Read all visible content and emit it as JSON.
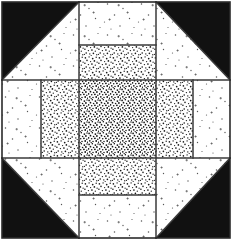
{
  "figure": {
    "title": "Quilt Block Pattern",
    "kind": "quilt-block-diagram",
    "width": 234,
    "height": 243,
    "background_color": "#ffffff",
    "outline_color": "#000000"
  },
  "colors": {
    "black": "#111111",
    "white": "#ffffff",
    "line": "#3a3a3a",
    "stipple_dot": "#1a1a1a",
    "speckle_dot": "#555555",
    "frame": "#2b2b2b"
  },
  "geometry": {
    "frame": {
      "x": 2,
      "y": 2,
      "width": 228,
      "height": 236,
      "stroke_width": 1.6
    },
    "grid_x": [
      2,
      41,
      79,
      156,
      193,
      230
    ],
    "grid_y": [
      2,
      45,
      80,
      158,
      195,
      238
    ],
    "corner_triangle_size": 78
  },
  "patches": [
    {
      "id": "corner-tl",
      "label": "Top-left corner triangle",
      "fill": "black",
      "shape": "triangle",
      "points": "2,2 79,2 2,80"
    },
    {
      "id": "corner-tr",
      "label": "Top-right corner triangle",
      "fill": "black",
      "shape": "triangle",
      "points": "230,2 230,80 156,2"
    },
    {
      "id": "corner-bl",
      "label": "Bottom-left corner triangle",
      "fill": "black",
      "shape": "triangle",
      "points": "2,238 2,158 79,238"
    },
    {
      "id": "corner-br",
      "label": "Bottom-right corner triangle",
      "fill": "black",
      "shape": "triangle",
      "points": "230,238 156,238 230,158"
    },
    {
      "id": "white-tri-tl",
      "label": "Top-left white triangle",
      "fill": "speckle",
      "shape": "triangle",
      "points": "79,2 79,80 2,80"
    },
    {
      "id": "white-tri-tr",
      "label": "Top-right white triangle",
      "fill": "speckle",
      "shape": "triangle",
      "points": "156,2 230,80 156,80"
    },
    {
      "id": "white-tri-bl",
      "label": "Bottom-left white triangle",
      "fill": "speckle",
      "shape": "triangle",
      "points": "79,238 79,158 2,158"
    },
    {
      "id": "white-tri-br",
      "label": "Bottom-right white triangle",
      "fill": "speckle",
      "shape": "triangle",
      "points": "156,238 156,158 230,158"
    },
    {
      "id": "top-center-white",
      "label": "Top centre white rectangle",
      "fill": "speckle",
      "shape": "rect",
      "x": 79,
      "y": 2,
      "width": 77,
      "height": 43
    },
    {
      "id": "top-center-stipple",
      "label": "Top centre stippled rectangle",
      "fill": "stipple",
      "shape": "rect",
      "x": 79,
      "y": 45,
      "width": 77,
      "height": 35
    },
    {
      "id": "bottom-center-stipple",
      "label": "Bottom centre stippled rectangle",
      "fill": "stipple",
      "shape": "rect",
      "x": 79,
      "y": 158,
      "width": 77,
      "height": 37
    },
    {
      "id": "bottom-center-white",
      "label": "Bottom centre white rectangle",
      "fill": "speckle",
      "shape": "rect",
      "x": 79,
      "y": 195,
      "width": 77,
      "height": 43
    },
    {
      "id": "mid-left-white",
      "label": "Middle-left white rectangle",
      "fill": "speckle",
      "shape": "rect",
      "x": 2,
      "y": 80,
      "width": 39,
      "height": 78
    },
    {
      "id": "mid-left-stipple",
      "label": "Middle-left stippled rectangle",
      "fill": "stipple",
      "shape": "rect",
      "x": 41,
      "y": 80,
      "width": 38,
      "height": 78
    },
    {
      "id": "center-stipple",
      "label": "Centre stippled square",
      "fill": "stipple-dense",
      "shape": "rect",
      "x": 79,
      "y": 80,
      "width": 77,
      "height": 78
    },
    {
      "id": "mid-right-stipple",
      "label": "Middle-right stippled rectangle",
      "fill": "stipple",
      "shape": "rect",
      "x": 156,
      "y": 80,
      "width": 37,
      "height": 78
    },
    {
      "id": "mid-right-white",
      "label": "Middle-right white rectangle",
      "fill": "speckle",
      "shape": "rect",
      "x": 193,
      "y": 80,
      "width": 37,
      "height": 78
    }
  ],
  "seam_lines": [
    {
      "id": "seam-v-left-outer",
      "x1": 41,
      "y1": 80,
      "x2": 41,
      "y2": 158
    },
    {
      "id": "seam-v-left-inner",
      "x1": 79,
      "y1": 2,
      "x2": 79,
      "y2": 238
    },
    {
      "id": "seam-v-right-inner",
      "x1": 156,
      "y1": 2,
      "x2": 156,
      "y2": 238
    },
    {
      "id": "seam-v-right-outer",
      "x1": 193,
      "y1": 80,
      "x2": 193,
      "y2": 158
    },
    {
      "id": "seam-h-top-inner",
      "x1": 79,
      "y1": 45,
      "x2": 156,
      "y2": 45
    },
    {
      "id": "seam-h-upper",
      "x1": 2,
      "y1": 80,
      "x2": 230,
      "y2": 80
    },
    {
      "id": "seam-h-lower",
      "x1": 2,
      "y1": 158,
      "x2": 230,
      "y2": 158
    },
    {
      "id": "seam-h-bottom-inner",
      "x1": 79,
      "y1": 195,
      "x2": 156,
      "y2": 195
    },
    {
      "id": "seam-d-tl",
      "x1": 2,
      "y1": 80,
      "x2": 79,
      "y2": 2
    },
    {
      "id": "seam-d-tr",
      "x1": 156,
      "y1": 2,
      "x2": 230,
      "y2": 80
    },
    {
      "id": "seam-d-bl",
      "x1": 2,
      "y1": 158,
      "x2": 79,
      "y2": 238
    },
    {
      "id": "seam-d-br",
      "x1": 156,
      "y1": 238,
      "x2": 230,
      "y2": 158
    }
  ]
}
